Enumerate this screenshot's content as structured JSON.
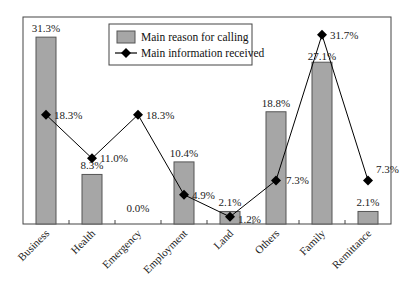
{
  "chart_data": {
    "type": "bar",
    "title": "",
    "xlabel": "",
    "ylabel": "",
    "ylim": [
      0,
      35
    ],
    "grid": false,
    "legend_position": "top-center (inside plot)",
    "categories": [
      "Business",
      "Health",
      "Emergency",
      "Employment",
      "Land",
      "Others",
      "Family",
      "Remittance"
    ],
    "series": [
      {
        "name": "Main reason for calling",
        "type": "bar",
        "color": "#a6a6a6",
        "values": [
          31.3,
          8.3,
          0.0,
          10.4,
          2.1,
          18.8,
          27.1,
          2.1
        ],
        "labels": [
          "31.3%",
          "8.3%",
          "0.0%",
          "10.4%",
          "2.1%",
          "18.8%",
          "27.1%",
          "2.1%"
        ]
      },
      {
        "name": "Main information received",
        "type": "line",
        "marker": "diamond",
        "color": "#000000",
        "values": [
          18.3,
          11.0,
          18.3,
          4.9,
          1.2,
          7.3,
          31.7,
          7.3
        ],
        "labels": [
          "18.3%",
          "11.0%",
          "18.3%",
          "4.9%",
          "1.2%",
          "7.3%",
          "31.7%",
          "7.3%"
        ]
      }
    ]
  },
  "legend": {
    "items": [
      {
        "label": "Main reason for calling",
        "symbol": "gray-box"
      },
      {
        "label": "Main information received",
        "symbol": "diamond-line"
      }
    ]
  }
}
